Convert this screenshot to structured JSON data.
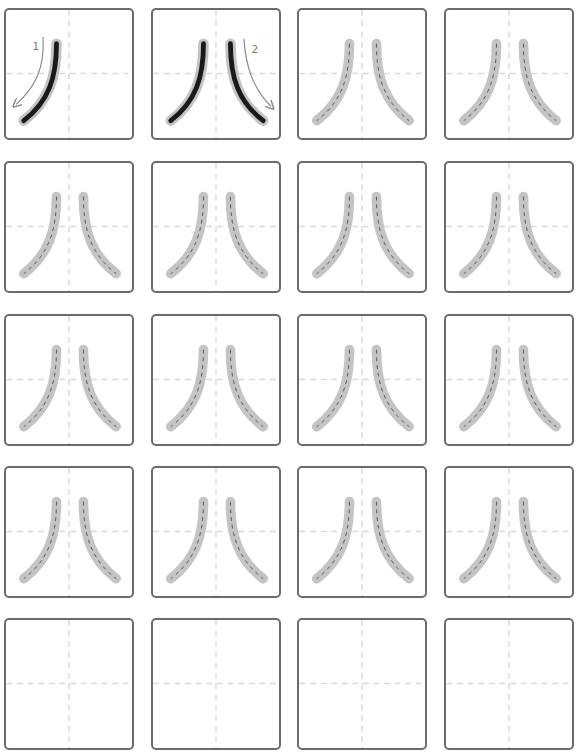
{
  "worksheet": {
    "character": "八",
    "columns": [
      4,
      151,
      297,
      444
    ],
    "rows": [
      8,
      161,
      314,
      466,
      618
    ],
    "cell_size": {
      "w": 130,
      "h": 133
    },
    "colors": {
      "border": "#6b6b6b",
      "guide": "#d9d9d9",
      "trace": "#c4c4c4",
      "ink": "#1a1a1a",
      "arrow": "#8a8a8a"
    },
    "stroke_labels": [
      "1",
      "2"
    ],
    "cells": [
      {
        "mode": "stroke1"
      },
      {
        "mode": "stroke2"
      },
      {
        "mode": "trace"
      },
      {
        "mode": "trace"
      },
      {
        "mode": "trace"
      },
      {
        "mode": "trace"
      },
      {
        "mode": "trace"
      },
      {
        "mode": "trace"
      },
      {
        "mode": "trace"
      },
      {
        "mode": "trace"
      },
      {
        "mode": "trace"
      },
      {
        "mode": "trace"
      },
      {
        "mode": "trace"
      },
      {
        "mode": "trace"
      },
      {
        "mode": "trace"
      },
      {
        "mode": "trace"
      },
      {
        "mode": "blank"
      },
      {
        "mode": "blank"
      },
      {
        "mode": "blank"
      },
      {
        "mode": "blank"
      }
    ]
  }
}
